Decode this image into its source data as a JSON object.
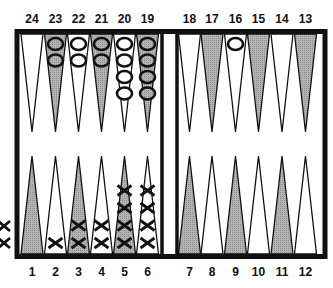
{
  "diagram": {
    "type": "backgammon-board",
    "colors": {
      "frame": "#111111",
      "shaded_point": "#a9a9a9",
      "light_point": "#ffffff",
      "checker_outline": "#111111"
    },
    "top_labels": [
      "24",
      "23",
      "22",
      "21",
      "20",
      "19",
      "18",
      "17",
      "16",
      "15",
      "14",
      "13"
    ],
    "bottom_labels": [
      "1",
      "2",
      "3",
      "4",
      "5",
      "6",
      "7",
      "8",
      "9",
      "10",
      "11",
      "12"
    ],
    "points": [
      {
        "point": 1,
        "shaded": true,
        "checkers": 0,
        "player": ""
      },
      {
        "point": 2,
        "shaded": false,
        "checkers": 1,
        "player": "X"
      },
      {
        "point": 3,
        "shaded": true,
        "checkers": 2,
        "player": "X"
      },
      {
        "point": 4,
        "shaded": false,
        "checkers": 2,
        "player": "X"
      },
      {
        "point": 5,
        "shaded": true,
        "checkers": 4,
        "player": "X"
      },
      {
        "point": 6,
        "shaded": false,
        "checkers": 4,
        "player": "X"
      },
      {
        "point": 7,
        "shaded": true,
        "checkers": 0,
        "player": ""
      },
      {
        "point": 8,
        "shaded": false,
        "checkers": 0,
        "player": ""
      },
      {
        "point": 9,
        "shaded": true,
        "checkers": 0,
        "player": ""
      },
      {
        "point": 10,
        "shaded": false,
        "checkers": 0,
        "player": ""
      },
      {
        "point": 11,
        "shaded": true,
        "checkers": 0,
        "player": ""
      },
      {
        "point": 12,
        "shaded": false,
        "checkers": 0,
        "player": ""
      },
      {
        "point": 13,
        "shaded": true,
        "checkers": 0,
        "player": ""
      },
      {
        "point": 14,
        "shaded": false,
        "checkers": 0,
        "player": ""
      },
      {
        "point": 15,
        "shaded": true,
        "checkers": 0,
        "player": ""
      },
      {
        "point": 16,
        "shaded": false,
        "checkers": 1,
        "player": "O"
      },
      {
        "point": 17,
        "shaded": true,
        "checkers": 0,
        "player": ""
      },
      {
        "point": 18,
        "shaded": false,
        "checkers": 0,
        "player": ""
      },
      {
        "point": 19,
        "shaded": true,
        "checkers": 4,
        "player": "O"
      },
      {
        "point": 20,
        "shaded": false,
        "checkers": 4,
        "player": "O"
      },
      {
        "point": 21,
        "shaded": true,
        "checkers": 2,
        "player": "O"
      },
      {
        "point": 22,
        "shaded": false,
        "checkers": 2,
        "player": "O"
      },
      {
        "point": 23,
        "shaded": true,
        "checkers": 2,
        "player": "O"
      },
      {
        "point": 24,
        "shaded": false,
        "checkers": 0,
        "player": ""
      }
    ],
    "borne_off": {
      "X": 2,
      "O": 0
    }
  }
}
